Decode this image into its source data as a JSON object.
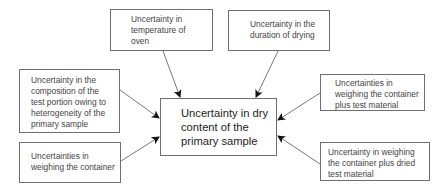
{
  "diagram": {
    "type": "cause-effect",
    "center": {
      "id": "dry_content",
      "label": "Uncertainty in dry\ncontent of the\nprimary sample"
    },
    "nodes": [
      {
        "id": "oven_temp",
        "label": "Uncertainty in\ntemperature of\noven"
      },
      {
        "id": "drying_duration",
        "label": "Uncertainty in the\nduration of drying"
      },
      {
        "id": "composition",
        "label": "Uncertainty in the\ncomposition of the\ntest portion owing to\nheterogeneity of the\nprimary sample"
      },
      {
        "id": "weigh_container",
        "label": "Uncertainties in\nweighing the container"
      },
      {
        "id": "weigh_container_test",
        "label": "Uncertainties in\nweighing the container\nplus test material"
      },
      {
        "id": "weigh_container_dried",
        "label": "Uncertainty in weighing\nthe container plus dried\ntest material"
      }
    ],
    "edges": [
      {
        "from": "oven_temp",
        "to": "dry_content"
      },
      {
        "from": "drying_duration",
        "to": "dry_content"
      },
      {
        "from": "composition",
        "to": "dry_content"
      },
      {
        "from": "weigh_container",
        "to": "dry_content"
      },
      {
        "from": "weigh_container_test",
        "to": "dry_content"
      },
      {
        "from": "weigh_container_dried",
        "to": "dry_content"
      }
    ]
  }
}
